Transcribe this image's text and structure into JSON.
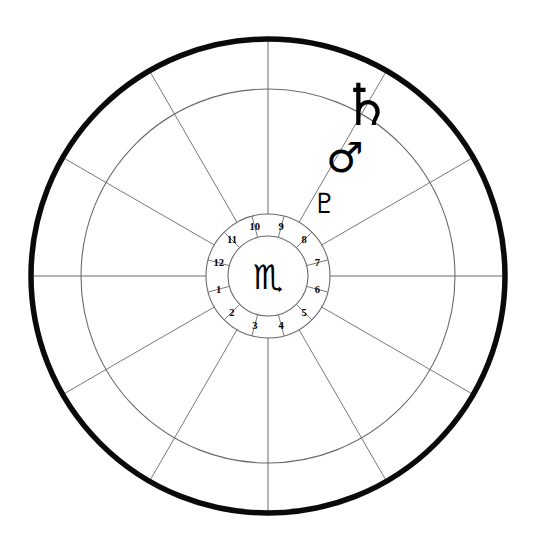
{
  "chart_data": {
    "type": "pie",
    "xlabel": "",
    "ylabel": "",
    "legend_position": "none",
    "grid": true,
    "center_sign_glyph": "♏",
    "center_sign_name": "Scorpio",
    "categories": [
      "1",
      "2",
      "3",
      "4",
      "5",
      "6",
      "7",
      "8",
      "9",
      "10",
      "11",
      "12"
    ],
    "values": [
      30,
      30,
      30,
      30,
      30,
      30,
      30,
      30,
      30,
      30,
      30,
      30
    ],
    "houses": [
      {
        "label": "1",
        "angle_deg": 195
      },
      {
        "label": "2",
        "angle_deg": 225
      },
      {
        "label": "3",
        "angle_deg": 255
      },
      {
        "label": "4",
        "angle_deg": 285
      },
      {
        "label": "5",
        "angle_deg": 315
      },
      {
        "label": "6",
        "angle_deg": 345
      },
      {
        "label": "7",
        "angle_deg": 15
      },
      {
        "label": "8",
        "angle_deg": 45
      },
      {
        "label": "9",
        "angle_deg": 75
      },
      {
        "label": "10",
        "angle_deg": 105
      },
      {
        "label": "11",
        "angle_deg": 135
      },
      {
        "label": "12",
        "angle_deg": 165
      }
    ],
    "planets": [
      {
        "name": "Pluto",
        "glyph": "♇",
        "angle_deg": 52,
        "radius": 92,
        "size": 28
      },
      {
        "name": "Mars",
        "glyph": "♂",
        "angle_deg": 57,
        "radius": 141,
        "size": 42
      },
      {
        "name": "Saturn",
        "glyph": "♄",
        "angle_deg": 60,
        "radius": 197,
        "size": 58
      }
    ],
    "rings": [
      {
        "name": "outer-boundary-circle",
        "radius": 237,
        "stroke_width": 5.5
      },
      {
        "name": "zodiac-inner-circle",
        "radius": 187,
        "stroke_width": 1.1
      },
      {
        "name": "house-number-outer-circle",
        "radius": 62,
        "stroke_width": 1.1
      },
      {
        "name": "sign-inner-circle",
        "radius": 40,
        "stroke_width": 1.1
      }
    ],
    "geometry": {
      "center_x": 268,
      "center_y": 276,
      "spoke_count": 12,
      "spoke_step_deg": 30,
      "axis_angles_deg": [
        0,
        180,
        90,
        270
      ]
    },
    "colors": {
      "background": "#ffffff",
      "ink": "#000000",
      "gridline": "#6a6a6a",
      "outer_ring": "#0a0a0a"
    }
  },
  "meta": {
    "app_title": "Astrological Chart Wheel"
  }
}
